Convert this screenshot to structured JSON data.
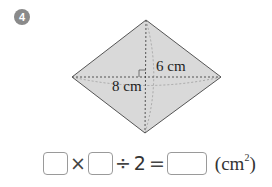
{
  "problem": {
    "number": "4",
    "figure": {
      "shape": "rhombus",
      "fill_color": "#d9d9d9",
      "stroke_color": "#555555",
      "labels": {
        "vertical_diagonal_half": "6 cm",
        "horizontal_diagonal": "8 cm"
      }
    },
    "equation": {
      "blank_1": "",
      "times": "×",
      "blank_2": "",
      "divide": "÷",
      "divisor": "2",
      "equals": "=",
      "blank_3": "",
      "unit_open": "(cm",
      "unit_exp": "2",
      "unit_close": ")"
    }
  }
}
